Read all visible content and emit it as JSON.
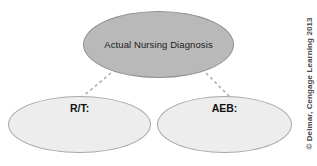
{
  "diagram": {
    "nodes": [
      {
        "id": "top",
        "label": "Actual Nursing Diagnosis",
        "fill": "#b9b9b9",
        "stroke": "#8e8e8e"
      },
      {
        "id": "rt",
        "label": "R/T:",
        "fill": "#ededed",
        "stroke": "#a9a9a9"
      },
      {
        "id": "aeb",
        "label": "AEB:",
        "fill": "#ededed",
        "stroke": "#a9a9a9"
      }
    ],
    "connectors": [
      {
        "id": "top-to-rt",
        "style": "dashed",
        "color": "#b0b0b0"
      },
      {
        "id": "top-to-aeb",
        "style": "dashed",
        "color": "#b0b0b0"
      }
    ]
  },
  "credit": {
    "text": "© Delmar, Cengage Learning 2013",
    "color": "#4a4a4a"
  }
}
